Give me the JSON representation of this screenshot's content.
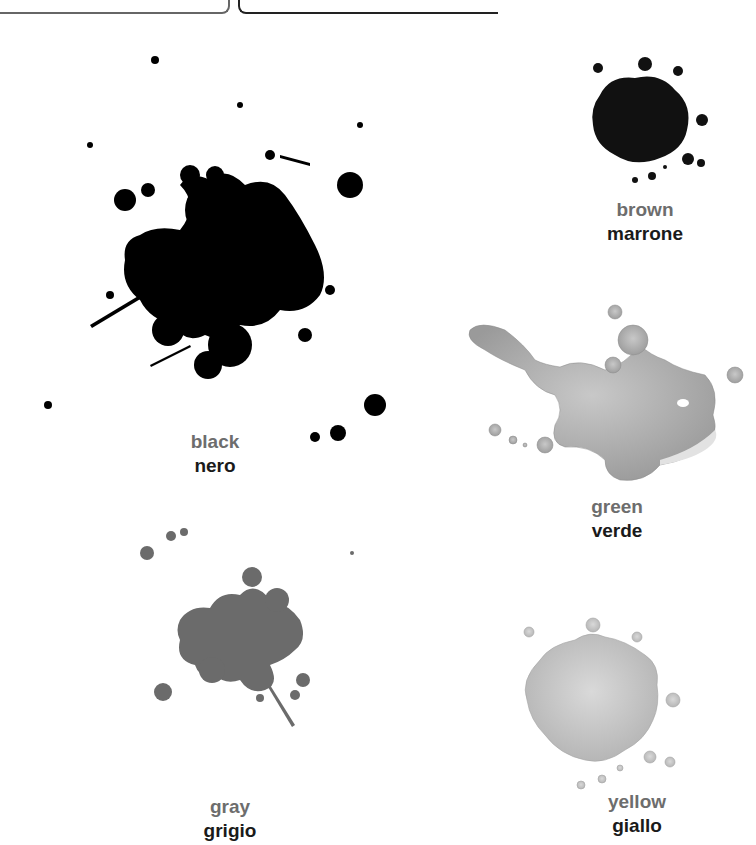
{
  "header": {
    "left_bracket": "",
    "right_bracket": ""
  },
  "colors": {
    "black_splat": "#000000",
    "brown_splat": "#111111",
    "green_splat": "#b5b5b5",
    "gray_splat": "#6b6b6b",
    "yellow_splat": "#c8c8c8",
    "english_label": "#6d6d6d",
    "italian_label": "#1a1a1a"
  },
  "items": [
    {
      "id": "black",
      "english": "black",
      "italian": "nero"
    },
    {
      "id": "brown",
      "english": "brown",
      "italian": "marrone"
    },
    {
      "id": "green",
      "english": "green",
      "italian": "verde"
    },
    {
      "id": "gray",
      "english": "gray",
      "italian": "grigio"
    },
    {
      "id": "yellow",
      "english": "yellow",
      "italian": "giallo"
    }
  ]
}
